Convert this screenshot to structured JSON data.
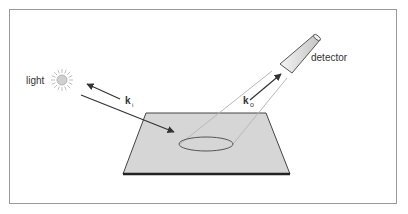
{
  "diagram": {
    "labels": {
      "light": "light",
      "detector": "detector",
      "k_incident": "k",
      "k_incident_sub": "i",
      "k_outgoing": "k",
      "k_outgoing_sub": "o"
    },
    "colors": {
      "frame": "#9a9a9a",
      "plane_fill": "#d6d6d6",
      "plane_edge": "#444444",
      "plane_front_edge": "#222222",
      "arrow": "#333333",
      "beam": "#b8b8b8",
      "sun": "#c8c8c8",
      "detector_fill": "#e2e2e2"
    }
  }
}
